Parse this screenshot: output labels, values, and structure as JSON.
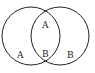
{
  "diagram": {
    "type": "venn",
    "stroke_color": "#222222",
    "background": "#ffffff",
    "circles": [
      {
        "name": "left",
        "cx": 31,
        "cy": 36,
        "r": 29
      },
      {
        "name": "right",
        "cx": 60,
        "cy": 36,
        "r": 29
      }
    ],
    "labels": {
      "left_only": "A",
      "overlap_top": "A",
      "overlap_bottom": "B",
      "right_only": "B"
    }
  }
}
